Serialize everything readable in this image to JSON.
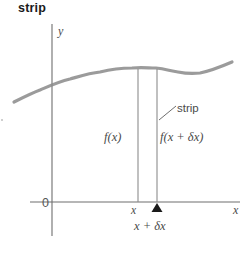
{
  "figure": {
    "title": "strip",
    "width": 252,
    "height": 255,
    "background": "#ffffff"
  },
  "axes": {
    "y_axis_label": "y",
    "x_axis_label": "x",
    "origin_label": "0",
    "axis_color": "#6e6e6e",
    "origin_px": {
      "x": 52,
      "y": 202
    },
    "x_axis_end_px": 240,
    "y_axis_top_px": 24
  },
  "curve": {
    "name": "function-curve",
    "color": "#8a8a8a",
    "stroke_width": 3.2,
    "points": [
      {
        "x": 14,
        "y": 102
      },
      {
        "x": 40,
        "y": 90
      },
      {
        "x": 70,
        "y": 79
      },
      {
        "x": 100,
        "y": 72
      },
      {
        "x": 130,
        "y": 68
      },
      {
        "x": 152,
        "y": 68
      },
      {
        "x": 172,
        "y": 71
      },
      {
        "x": 196,
        "y": 74
      },
      {
        "x": 214,
        "y": 71
      },
      {
        "x": 232,
        "y": 62
      }
    ]
  },
  "strip": {
    "callout_label": "strip",
    "left_boundary_x": 138,
    "right_boundary_x": 157,
    "top_y_left": 69,
    "top_y_right": 69,
    "bottom_y": 202,
    "boundary_color": "#8c8c8c",
    "leader_line": {
      "x1": 160,
      "y1": 119,
      "x2": 176,
      "y2": 106
    }
  },
  "labels": {
    "f_of_x": "f(x)",
    "f_of_x_plus_dx": "f(x + δx)",
    "tick_x": "x",
    "tick_x_plus_dx": "x + δx"
  },
  "marker": {
    "name": "triangle-marker",
    "color": "#1a1a1a",
    "x": 157,
    "y": 205,
    "width": 11,
    "height": 9
  }
}
